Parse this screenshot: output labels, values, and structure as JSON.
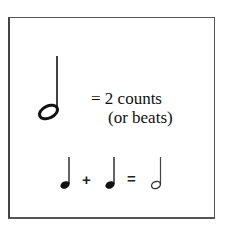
{
  "diagram": {
    "title_symbol": "half-note",
    "equation_line1": "= 2 counts",
    "equation_line2": "(or beats)",
    "bottom_equation": {
      "terms": [
        "quarter-note",
        "quarter-note"
      ],
      "plus": "+",
      "equals": "=",
      "result": "half-note"
    },
    "colors": {
      "ink": "#111111",
      "border": "#555555",
      "background": "#ffffff"
    }
  }
}
